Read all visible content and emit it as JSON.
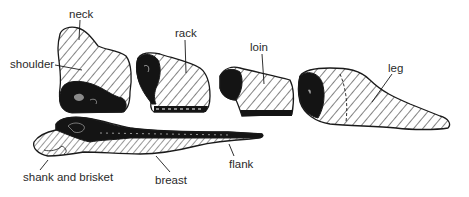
{
  "diagram": {
    "colors": {
      "outline": "#1a1a1a",
      "hatch": "#1a1a1a",
      "dark_tissue": "#141414",
      "background": "#ffffff",
      "label_text": "#2a2a2a"
    },
    "cuts": [
      {
        "id": "neck",
        "label": "neck",
        "label_pos": [
          69,
          9
        ]
      },
      {
        "id": "shoulder",
        "label": "shoulder",
        "label_pos": [
          10,
          59
        ]
      },
      {
        "id": "rack",
        "label": "rack",
        "label_pos": [
          175,
          28
        ]
      },
      {
        "id": "loin",
        "label": "loin",
        "label_pos": [
          250,
          42
        ]
      },
      {
        "id": "leg",
        "label": "leg",
        "label_pos": [
          388,
          63
        ]
      },
      {
        "id": "shank-and-brisket",
        "label": "shank and brisket",
        "label_pos": [
          23,
          172
        ]
      },
      {
        "id": "breast",
        "label": "breast",
        "label_pos": [
          155,
          175
        ]
      },
      {
        "id": "flank",
        "label": "flank",
        "label_pos": [
          229,
          159
        ]
      }
    ]
  }
}
